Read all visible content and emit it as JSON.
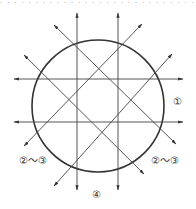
{
  "diagram": {
    "top_text": "· · · · · · · · · · · · · · · · · · · · · · · · · · · · ·",
    "circle": {
      "cx": 98,
      "cy": 106,
      "r": 66,
      "stroke": "#333333"
    },
    "line_color": "#444444",
    "labels": {
      "right": "①",
      "bottom_left": "②～③",
      "bottom_right": "②～③",
      "bottom": "④"
    },
    "lines": [
      {
        "id": "vertical-left",
        "x1": 77,
        "y1": 190,
        "x2": 77,
        "y2": 13
      },
      {
        "id": "vertical-right",
        "x1": 118,
        "y1": 190,
        "x2": 118,
        "y2": 13
      },
      {
        "id": "horizontal-top",
        "x1": 183,
        "y1": 79,
        "x2": 14,
        "y2": 79
      },
      {
        "id": "horizontal-bottom",
        "x1": 183,
        "y1": 122,
        "x2": 14,
        "y2": 122
      },
      {
        "id": "diagonal-up-right-outer",
        "x1": 54,
        "y1": 186,
        "x2": 172,
        "y2": 54
      },
      {
        "id": "diagonal-up-right-inner",
        "x1": 24,
        "y1": 146,
        "x2": 142,
        "y2": 24
      },
      {
        "id": "diagonal-down-right-outer",
        "x1": 54,
        "y1": 25,
        "x2": 176,
        "y2": 144
      },
      {
        "id": "diagonal-down-right-inner",
        "x1": 24,
        "y1": 55,
        "x2": 144,
        "y2": 174
      }
    ]
  }
}
